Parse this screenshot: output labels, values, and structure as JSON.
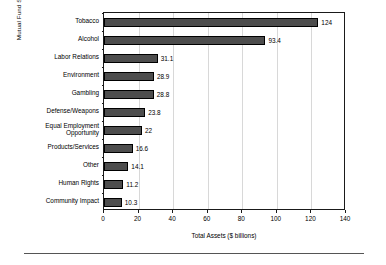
{
  "chart_data": {
    "type": "bar",
    "orientation": "horizontal",
    "title": "",
    "xlabel": "Total Assets ($ billions)",
    "ylabel": "Mutual Fund Screen Types",
    "categories": [
      "Tobacco",
      "Alcohol",
      "Labor Relations",
      "Environment",
      "Gambling",
      "Defense/Weapons",
      "Equal Employment\nOpportunity",
      "Products/Services",
      "Other",
      "Human Rights",
      "Community Impact"
    ],
    "values": [
      124,
      93.4,
      31.1,
      28.9,
      28.8,
      23.8,
      22,
      16.6,
      14.1,
      11.2,
      10.3
    ],
    "value_labels": [
      "124",
      "93.4",
      "31.1",
      "28.9",
      "28.8",
      "23.8",
      "22",
      "16.6",
      "14.1",
      "11.2",
      "10.3"
    ],
    "xlim": [
      0,
      140
    ],
    "xticks": [
      0,
      20,
      40,
      60,
      80,
      100,
      120,
      140
    ],
    "xtick_labels": [
      "0",
      "20",
      "40",
      "60",
      "80",
      "100",
      "120",
      "140"
    ],
    "grid": "vertical-light",
    "legend": "none",
    "bar_color": "#4d4d4d",
    "bar_edge_color": "#000000",
    "axis_color": "#1a1a1a",
    "gridline_color": "#d8d8d8"
  }
}
